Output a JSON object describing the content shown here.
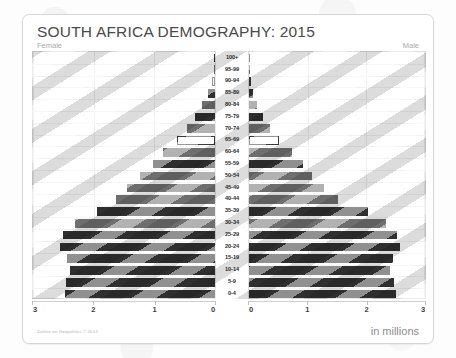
{
  "title": "SOUTH AFRICA DEMOGRAPHY: 2015",
  "labels": {
    "female": "Female",
    "male": "Male",
    "units": "in millions",
    "source": "Zahlen on Geopolitics © 2013"
  },
  "chart_data": {
    "type": "bar",
    "subtype": "population-pyramid",
    "title": "SOUTH AFRICA DEMOGRAPHY: 2015",
    "xlabel": "in millions",
    "ylabel": "Age group",
    "xlim": [
      0,
      3
    ],
    "xticks": [
      0,
      1,
      2,
      3
    ],
    "xtick_labels": [
      "0",
      "1",
      "2",
      "3"
    ],
    "grid": true,
    "legend": "none",
    "left_axis_direction": "reversed",
    "categories": [
      "0-4",
      "5-9",
      "10-14",
      "15-19",
      "20-24",
      "25-29",
      "30-34",
      "35-39",
      "40-44",
      "45-49",
      "50-54",
      "55-59",
      "60-64",
      "65-69",
      "70-74",
      "75-79",
      "80-84",
      "85-89",
      "90-94",
      "95-99",
      "100+"
    ],
    "series": [
      {
        "name": "Female",
        "side": "left",
        "values": [
          2.48,
          2.46,
          2.39,
          2.44,
          2.55,
          2.5,
          2.3,
          1.95,
          1.63,
          1.45,
          1.23,
          1.03,
          0.85,
          0.62,
          0.46,
          0.33,
          0.22,
          0.11,
          0.05,
          0.02,
          0.01
        ]
      },
      {
        "name": "Male",
        "side": "right",
        "values": [
          2.5,
          2.48,
          2.41,
          2.45,
          2.57,
          2.53,
          2.33,
          2.02,
          1.52,
          1.28,
          1.08,
          0.92,
          0.73,
          0.51,
          0.35,
          0.24,
          0.14,
          0.07,
          0.03,
          0.01,
          0.005
        ]
      }
    ]
  },
  "colors": {
    "bar_dark": "#2f2f2f",
    "bar_mid": "#6e6e6e",
    "bar_light": "#ffffff",
    "grid": "#ebebeb",
    "frame": "#d6d6d6",
    "title_text": "#4a4a4a",
    "side_label_text": "#a9a9a9"
  }
}
